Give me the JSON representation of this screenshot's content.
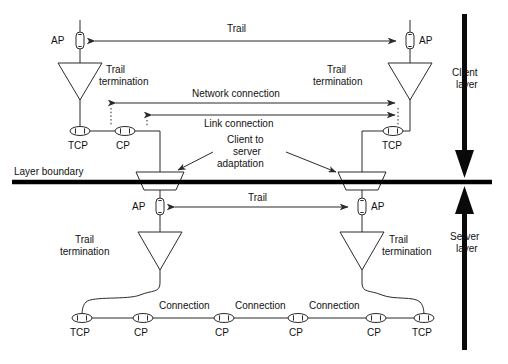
{
  "figure": {
    "canvas": {
      "width": 508,
      "height": 364
    },
    "colors": {
      "line": "#2a2a2a",
      "boundary": "#000000",
      "text": "#111111",
      "symbol_fill": "#ffffff",
      "background": "#ffffff"
    }
  },
  "labels": {
    "trail_top": "Trail",
    "trail_middle": "Trail",
    "network_connection": "Network connection",
    "link_connection": "Link connection",
    "client_to_server_adaptation_line1": "Client to",
    "client_to_server_adaptation_line2": "server",
    "client_to_server_adaptation_line3": "adaptation",
    "layer_boundary": "Layer boundary",
    "client_layer_line1": "Client",
    "client_layer_line2": "layer",
    "server_layer_line1": "Server",
    "server_layer_line2": "layer",
    "trail_termination_line1": "Trail",
    "trail_termination_line2": "termination",
    "ap": "AP",
    "tcp": "TCP",
    "cp": "CP",
    "connection": "Connection"
  },
  "client_layer": {
    "name": "Client layer",
    "trail": {
      "label": "Trail",
      "arrow_style": "double-headed",
      "endpoints": [
        "left-AP",
        "right-AP"
      ]
    },
    "access_points": [
      {
        "id": "client-ap-left",
        "label": "AP",
        "label_side": "left"
      },
      {
        "id": "client-ap-right",
        "label": "AP",
        "label_side": "right"
      }
    ],
    "trail_terminations": [
      {
        "id": "client-tt-left",
        "label_line1": "Trail",
        "label_line2": "termination",
        "label_side": "right"
      },
      {
        "id": "client-tt-right",
        "label_line1": "Trail",
        "label_line2": "termination",
        "label_side": "left"
      }
    ],
    "connections": [
      {
        "id": "network-connection",
        "label": "Network connection",
        "arrow_style": "double-headed",
        "terminates_at": "TCP"
      },
      {
        "id": "link-connection",
        "label": "Link connection",
        "arrow_style": "double-headed",
        "terminates_at": "CP"
      }
    ],
    "connection_points": [
      {
        "id": "client-tcp-left",
        "label": "TCP"
      },
      {
        "id": "client-cp-left",
        "label": "CP"
      },
      {
        "id": "client-tcp-right",
        "label": "TCP"
      }
    ]
  },
  "adaptation": {
    "label_line1": "Client to",
    "label_line2": "server",
    "label_line3": "adaptation",
    "functions": [
      {
        "id": "adaptation-left",
        "shape": "trapezoid"
      },
      {
        "id": "adaptation-right",
        "shape": "trapezoid"
      }
    ]
  },
  "boundary": {
    "label": "Layer boundary"
  },
  "server_layer": {
    "name": "Server layer",
    "trail": {
      "label": "Trail",
      "arrow_style": "double-headed",
      "endpoints": [
        "left-AP",
        "right-AP"
      ]
    },
    "access_points": [
      {
        "id": "server-ap-left",
        "label": "AP",
        "label_side": "left"
      },
      {
        "id": "server-ap-right",
        "label": "AP",
        "label_side": "right"
      }
    ],
    "trail_terminations": [
      {
        "id": "server-tt-left",
        "label_line1": "Trail",
        "label_line2": "termination",
        "label_side": "left"
      },
      {
        "id": "server-tt-right",
        "label_line1": "Trail",
        "label_line2": "termination",
        "label_side": "right"
      }
    ],
    "connection_chain": {
      "points": [
        {
          "id": "server-tcp-left",
          "label": "TCP"
        },
        {
          "id": "server-cp-1",
          "label": "CP"
        },
        {
          "id": "server-cp-2",
          "label": "CP"
        },
        {
          "id": "server-cp-3",
          "label": "CP"
        },
        {
          "id": "server-cp-4",
          "label": "CP"
        },
        {
          "id": "server-tcp-right",
          "label": "TCP"
        }
      ],
      "segments": [
        {
          "id": "connection-1",
          "label": "Connection"
        },
        {
          "id": "connection-2",
          "label": "Connection"
        },
        {
          "id": "connection-3",
          "label": "Connection"
        }
      ]
    }
  },
  "layer_indicators": [
    {
      "id": "client-layer-indicator",
      "line1": "Client",
      "line2": "layer",
      "direction": "down"
    },
    {
      "id": "server-layer-indicator",
      "line1": "Server",
      "line2": "layer",
      "direction": "up"
    }
  ]
}
